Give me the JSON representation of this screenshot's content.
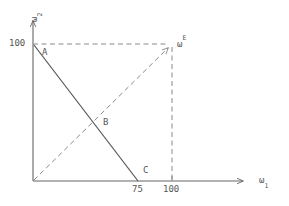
{
  "figure": {
    "kind": "economics-endowment-diagram",
    "background_color": "#ffffff",
    "solid_line_color": "#555555",
    "dashed_line_color": "#8a8a8a",
    "axis_color": "#666666",
    "text_color": "#565656"
  },
  "axes": {
    "x": {
      "name": "ω",
      "name_subscript": "1",
      "ticks": [
        {
          "label": "75",
          "value": 75
        },
        {
          "label": "100",
          "value": 100
        }
      ]
    },
    "y": {
      "name": "ω",
      "name_subscript": "2",
      "ticks": [
        {
          "label": "100",
          "value": 100
        }
      ]
    }
  },
  "points": [
    {
      "id": "A",
      "label": "A",
      "x": 0,
      "y": 100
    },
    {
      "id": "B",
      "label": "B",
      "x": 41,
      "y": 46
    },
    {
      "id": "C",
      "label": "C",
      "x": 75,
      "y": 0
    },
    {
      "id": "E",
      "label": "ω",
      "superscript": "E",
      "x": 100,
      "y": 100
    }
  ],
  "lines": [
    {
      "id": "budget-line",
      "style": "solid",
      "from": {
        "x": 0,
        "y": 100
      },
      "to": {
        "x": 75,
        "y": 0
      }
    },
    {
      "id": "endowment-ray",
      "style": "dashed",
      "arrow": true,
      "from": {
        "x": 0,
        "y": 0
      },
      "to": {
        "x": 100,
        "y": 100
      }
    },
    {
      "id": "endowment-horizontal-guide",
      "style": "dashed",
      "from": {
        "x": 0,
        "y": 100
      },
      "to": {
        "x": 100,
        "y": 100
      }
    },
    {
      "id": "endowment-vertical-guide",
      "style": "dashed",
      "from": {
        "x": 100,
        "y": 100
      },
      "to": {
        "x": 100,
        "y": 0
      }
    }
  ]
}
